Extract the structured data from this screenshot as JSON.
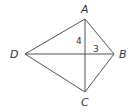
{
  "diagram": {
    "type": "kite",
    "vertices": {
      "A": {
        "label": "A"
      },
      "B": {
        "label": "B"
      },
      "C": {
        "label": "C"
      },
      "D": {
        "label": "D"
      }
    },
    "segment_labels": {
      "vertical_upper": "4",
      "horizontal_right": "3"
    },
    "colors": {
      "stroke": "#555555",
      "text": "#333333",
      "background": "#ffffff"
    }
  }
}
